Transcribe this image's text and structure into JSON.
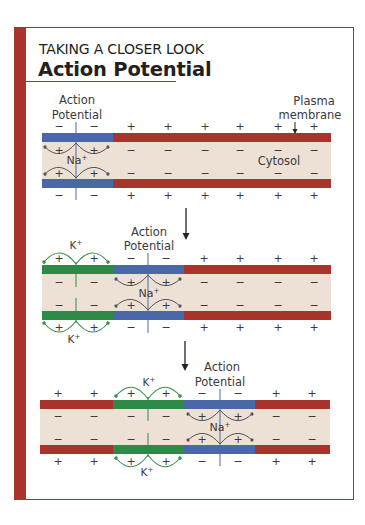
{
  "header": {
    "kicker": "TAKING A CLOSER LOOK",
    "title": "Action Potential"
  },
  "labels": {
    "action_potential_line1": "Action",
    "action_potential_line2": "Potential",
    "plasma_membrane_line1": "Plasma",
    "plasma_membrane_line2": "membrane",
    "cytosol": "Cytosol",
    "sodium_ion": "Na+",
    "potassium_ion": "K+",
    "plus": "+",
    "minus": "−"
  },
  "colors": {
    "frame": "#a8342b",
    "resting_membrane": "#a8342b",
    "depolarized_membrane": "#4a68a8",
    "repolarizing_membrane": "#2e8b47",
    "cytosol": "#ede1d5",
    "na_arrow": "#555555",
    "k_arrow": "#3a8f4a"
  },
  "panels": [
    {
      "step": 1,
      "segments": [
        {
          "state": "depolarized",
          "color": "#4a68a8"
        },
        {
          "state": "resting",
          "color": "#a8342b"
        }
      ],
      "outside_charges": [
        "−",
        "−",
        "+",
        "+",
        "+",
        "+",
        "+",
        "+"
      ],
      "inside_charges": [
        "+",
        "+",
        "−",
        "−",
        "−",
        "−",
        "−",
        "−"
      ],
      "ion_flow": [
        {
          "ion": "Na+",
          "direction": "in"
        }
      ]
    },
    {
      "step": 2,
      "segments": [
        {
          "state": "repolarizing",
          "color": "#2e8b47"
        },
        {
          "state": "depolarized",
          "color": "#4a68a8"
        },
        {
          "state": "resting",
          "color": "#a8342b"
        }
      ],
      "outside_charges": [
        "+",
        "+",
        "−",
        "−",
        "+",
        "+",
        "+",
        "+"
      ],
      "inside_charges": [
        "−",
        "−",
        "+",
        "+",
        "−",
        "−",
        "−",
        "−"
      ],
      "ion_flow": [
        {
          "ion": "K+",
          "direction": "out"
        },
        {
          "ion": "Na+",
          "direction": "in"
        }
      ]
    },
    {
      "step": 3,
      "segments": [
        {
          "state": "resting",
          "color": "#a8342b"
        },
        {
          "state": "repolarizing",
          "color": "#2e8b47"
        },
        {
          "state": "depolarized",
          "color": "#4a68a8"
        },
        {
          "state": "resting",
          "color": "#a8342b"
        }
      ],
      "outside_charges": [
        "+",
        "+",
        "+",
        "+",
        "−",
        "−",
        "+",
        "+"
      ],
      "inside_charges": [
        "−",
        "−",
        "−",
        "−",
        "+",
        "+",
        "−",
        "−"
      ],
      "ion_flow": [
        {
          "ion": "K+",
          "direction": "out"
        },
        {
          "ion": "Na+",
          "direction": "in"
        }
      ]
    }
  ]
}
